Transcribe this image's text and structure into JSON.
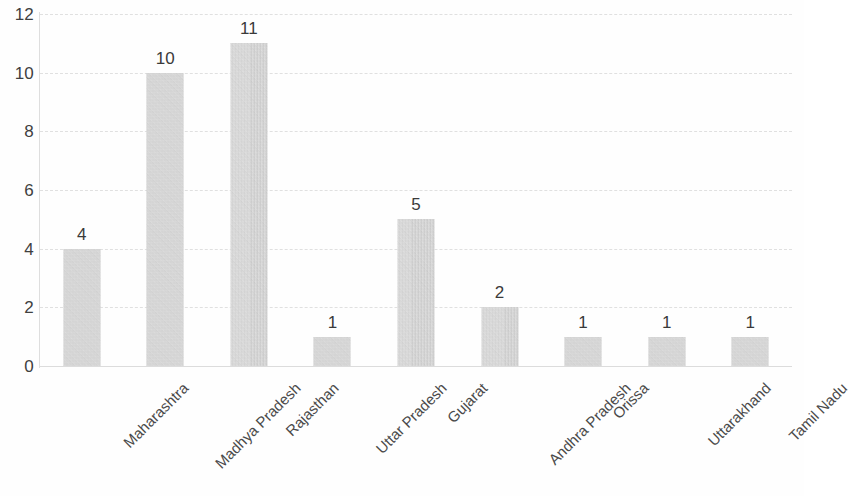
{
  "chart_data": {
    "type": "bar",
    "title": "",
    "subtitle": "",
    "xlabel": "",
    "ylabel": "",
    "ylim": [
      0,
      12
    ],
    "y_ticks": [
      0,
      2,
      4,
      6,
      8,
      10,
      12
    ],
    "grid": true,
    "legend": "none",
    "data_labels": true,
    "orientation": "vertical",
    "categories": [
      "Maharashtra",
      "Madhya Pradesh",
      "Rajasthan",
      "Uttar Pradesh",
      "Gujarat",
      "Andhra Pradesh",
      "Orissa",
      "Uttarakhand",
      "Tamil Nadu"
    ],
    "values": [
      4,
      10,
      11,
      1,
      5,
      2,
      1,
      1,
      1
    ],
    "value_labels": [
      "4",
      "10",
      "11",
      "1",
      "5",
      "2",
      "1",
      "1",
      "1"
    ],
    "y_tick_labels": [
      "0",
      "2",
      "4",
      "6",
      "8",
      "10",
      "12"
    ],
    "series": [
      {
        "name": "",
        "values": [
          4,
          10,
          11,
          1,
          5,
          2,
          1,
          1,
          1
        ]
      }
    ],
    "colors": {
      "bar_fill": "#d0d0d0",
      "gridline": "#e0e0e0",
      "axis_line": "#dedede",
      "text": "#3a3a3a",
      "background": "#fefefe"
    }
  }
}
